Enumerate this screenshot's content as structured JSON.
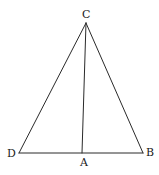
{
  "diagram": {
    "type": "triangle",
    "stroke_color": "#2a2a2a",
    "points": {
      "C": {
        "label": "C",
        "x": 86,
        "y": 23
      },
      "D": {
        "label": "D",
        "x": 19,
        "y": 153
      },
      "B": {
        "label": "B",
        "x": 143,
        "y": 153
      },
      "A": {
        "label": "A",
        "x": 82,
        "y": 153
      }
    },
    "segments": [
      {
        "from": "C",
        "to": "D"
      },
      {
        "from": "C",
        "to": "B"
      },
      {
        "from": "D",
        "to": "B"
      },
      {
        "from": "C",
        "to": "A"
      }
    ],
    "labels": {
      "C": "C",
      "D": "D",
      "A": "A",
      "B": "B"
    }
  }
}
